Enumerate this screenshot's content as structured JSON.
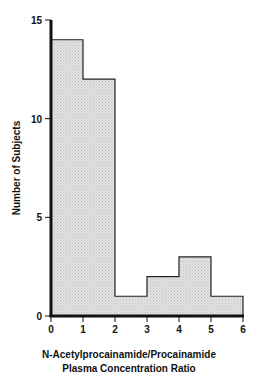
{
  "chart_data": {
    "type": "bar",
    "subtype": "histogram",
    "bin_edges": [
      0,
      1,
      2,
      3,
      4,
      5,
      6
    ],
    "categories": [
      "0-1",
      "1-2",
      "2-3",
      "3-4",
      "4-5",
      "5-6"
    ],
    "values": [
      14,
      12,
      1,
      2,
      3,
      1
    ],
    "title": "",
    "xlabel": "N-Acetylprocainamide/Procainamide Plasma Concentration Ratio",
    "xlabel_lines": [
      "N-Acetylprocainamide/Procainamide",
      "Plasma Concentration Ratio"
    ],
    "ylabel": "Number of Subjects",
    "xlim": [
      0,
      6
    ],
    "ylim": [
      0,
      15
    ],
    "xticks": [
      "0",
      "1",
      "2",
      "3",
      "4",
      "5",
      "6"
    ],
    "yticks": [
      "0",
      "5",
      "10",
      "15"
    ],
    "grid": false,
    "legend": null,
    "fill_color": "#dcdcdc",
    "edge_color": "#222222"
  }
}
